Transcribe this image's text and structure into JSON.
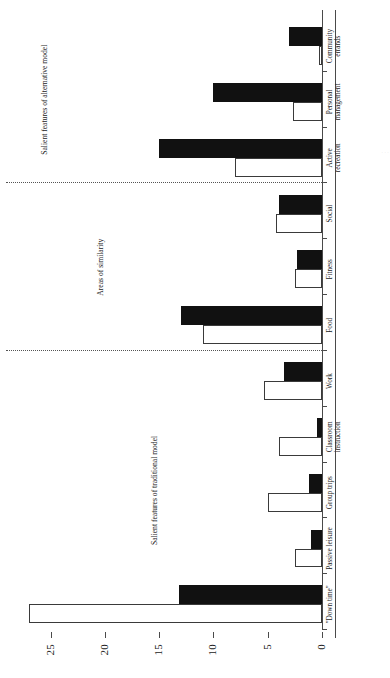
{
  "chart_data": {
    "type": "bar",
    "orientation": "horizontal-rotated",
    "title": "",
    "xlabel": "",
    "ylabel": "",
    "ylim": [
      0,
      28
    ],
    "grid": false,
    "legend": "",
    "ticks": [
      0,
      5,
      10,
      15,
      20,
      25
    ],
    "tick_labels": [
      "0",
      "5",
      "10",
      "15",
      "20",
      "25"
    ],
    "categories": [
      "\"Down time\"",
      "Passive leisure",
      "Group trips",
      "Classroom\ninstruction",
      "Work",
      "Food",
      "Fitness",
      "Social",
      "Active\nrecreation",
      "Personal\nmanagement",
      "Community\nerrands"
    ],
    "series": [
      {
        "name": "open",
        "style": "white-outline",
        "values": [
          27.0,
          2.5,
          5.0,
          4.0,
          5.3,
          11.0,
          2.5,
          4.2,
          8.0,
          2.7,
          0.3
        ]
      },
      {
        "name": "filled",
        "style": "black-solid",
        "values": [
          13.2,
          1.0,
          1.2,
          0.5,
          3.5,
          13.0,
          2.3,
          4.0,
          15.0,
          10.0,
          3.0
        ]
      }
    ],
    "annotations": [
      {
        "label": "Salient features of traditional model",
        "span": [
          0,
          4
        ]
      },
      {
        "label": "Areas of similarity",
        "span": [
          5,
          7
        ]
      },
      {
        "label": "Salient features of alternative model",
        "span": [
          8,
          10
        ]
      }
    ],
    "separators_after_category_index": [
      4,
      7
    ],
    "colors": {
      "filled": "#111111",
      "open": "#ffffff",
      "outline": "#3a3a3a",
      "axis": "#4a4a4a"
    }
  },
  "edge_caption": "· · ·"
}
